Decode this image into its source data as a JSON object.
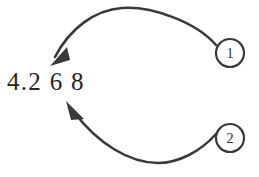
{
  "figure": {
    "background_color": "#ffffff",
    "stroke_color": "#3a3a3a",
    "text_color": "#262626"
  },
  "value": {
    "text": "4.2 6 8",
    "plain": "4.268"
  },
  "callouts": [
    {
      "label": "1",
      "marker_name": "callout-marker-1",
      "arrow_name": "callout-arrow-1",
      "circle": {
        "cx": 230,
        "cy": 53,
        "r": 14
      },
      "arrow_path": "M 216 45 C 196 22 152 6 122 8 C 95 10 70 28 55 57",
      "arrowhead_points": "50,66 67,47 70,60"
    },
    {
      "label": "2",
      "marker_name": "callout-marker-2",
      "arrow_name": "callout-arrow-2",
      "circle": {
        "cx": 230,
        "cy": 138,
        "r": 14
      },
      "arrow_path": "M 216 134 C 200 152 178 163 158 163 C 130 163 98 144 74 112",
      "arrowhead_points": "66,101 84,119 71,120"
    }
  ]
}
